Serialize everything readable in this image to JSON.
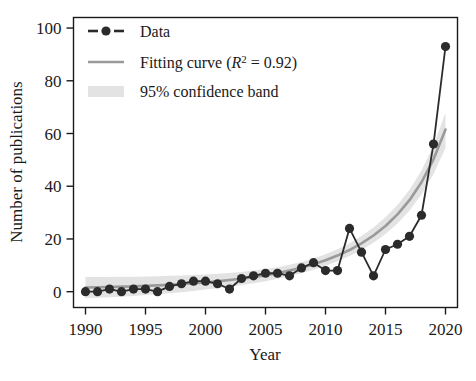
{
  "chart_data": {
    "type": "line",
    "title": "",
    "xlabel": "Year",
    "ylabel": "Number of publications",
    "xlim": [
      1989,
      2021
    ],
    "ylim": [
      -6,
      104
    ],
    "xticks": [
      1990,
      1995,
      2000,
      2005,
      2010,
      2015,
      2020
    ],
    "yticks": [
      0,
      20,
      40,
      60,
      80,
      100
    ],
    "grid": false,
    "legend_position": "top-left",
    "x": [
      1990,
      1991,
      1992,
      1993,
      1994,
      1995,
      1996,
      1997,
      1998,
      1999,
      2000,
      2001,
      2002,
      2003,
      2004,
      2005,
      2006,
      2007,
      2008,
      2009,
      2010,
      2011,
      2012,
      2013,
      2014,
      2015,
      2016,
      2017,
      2018,
      2019,
      2020
    ],
    "series": [
      {
        "name": "Data",
        "type": "markers-dashed",
        "color": "#2b2b2b",
        "values": [
          0,
          0,
          1,
          0,
          1,
          1,
          0,
          2,
          3,
          4,
          4,
          3,
          1,
          5,
          6,
          7,
          7,
          6,
          9,
          11,
          8,
          8,
          24,
          15,
          6,
          16,
          18,
          21,
          29,
          56,
          93
        ]
      },
      {
        "name": "Fitting curve (R^2 = 0.92)",
        "type": "line",
        "color": "#9a9a9a",
        "values": [
          1.6,
          1.7,
          1.8,
          1.9,
          2.0,
          2.2,
          2.4,
          2.6,
          2.9,
          3.2,
          3.5,
          3.9,
          4.4,
          4.9,
          5.5,
          6.2,
          7.0,
          8.0,
          9.1,
          10.4,
          11.9,
          13.7,
          15.8,
          18.3,
          21.3,
          24.9,
          29.3,
          34.7,
          41.5,
          50.2,
          61.5
        ]
      }
    ],
    "confidence_band": {
      "name": "95% confidence band",
      "level": "95%",
      "color": "#e3e3e3",
      "lower": [
        -2.5,
        -2.3,
        -2.1,
        -1.9,
        -1.6,
        -1.3,
        -1.0,
        -0.6,
        -0.2,
        0.3,
        0.8,
        1.3,
        1.9,
        2.5,
        3.2,
        4.0,
        4.9,
        5.9,
        7.0,
        8.3,
        9.8,
        11.5,
        13.5,
        15.8,
        18.6,
        21.9,
        25.9,
        30.8,
        36.9,
        44.6,
        54.5
      ],
      "upper": [
        5.6,
        5.6,
        5.6,
        5.7,
        5.7,
        5.8,
        5.9,
        6.0,
        6.1,
        6.3,
        6.5,
        6.8,
        7.1,
        7.5,
        8.0,
        8.6,
        9.3,
        10.2,
        11.3,
        12.6,
        14.2,
        16.1,
        18.4,
        21.1,
        24.3,
        28.2,
        32.9,
        38.7,
        46.0,
        55.4,
        68.0
      ]
    },
    "legend": [
      {
        "label": "Data",
        "marker": "dashed-circle",
        "color": "#2b2b2b"
      },
      {
        "label": "Fitting curve (R² = 0.92)",
        "marker": "line",
        "color": "#9a9a9a",
        "parts": {
          "prefix": "Fitting curve (",
          "italic": "R",
          "sup": "2",
          "suffix": " = 0.92)"
        }
      },
      {
        "label": "95% confidence band",
        "marker": "band",
        "color": "#e3e3e3"
      }
    ]
  },
  "colors": {
    "data": "#2b2b2b",
    "fit": "#9a9a9a",
    "band": "#e3e3e3",
    "axis": "#1a1a1a",
    "background": "#ffffff"
  }
}
